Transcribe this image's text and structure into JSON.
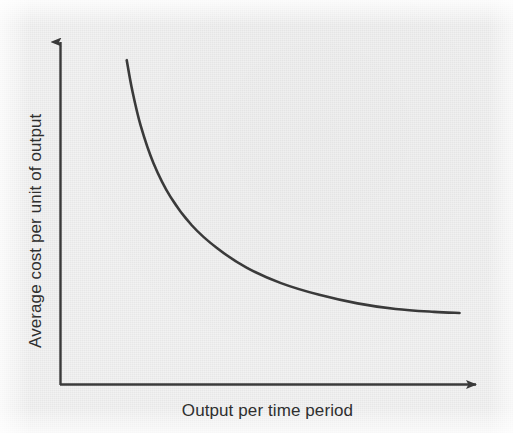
{
  "chart_data": {
    "type": "line",
    "title": "",
    "subtitle": "",
    "xlabel": "Output per time period",
    "ylabel": "Average cost per unit of output",
    "grid": false,
    "legend": null,
    "legend_position": "none",
    "axis_style": "arrow-headed, no tick marks, no numeric scale",
    "xlim": [
      0,
      1
    ],
    "ylim": [
      0,
      1
    ],
    "xticks": [],
    "yticks": [],
    "annotations": [],
    "series": [
      {
        "name": "Long-run average cost",
        "description": "Steeply falling convex curve that flattens toward a horizontal asymptote (economies of scale)",
        "color": "#3a3a3a",
        "line_width": 2.6,
        "x": [
          0.157,
          0.17,
          0.19,
          0.22,
          0.26,
          0.31,
          0.37,
          0.44,
          0.52,
          0.61,
          0.7,
          0.79,
          0.88,
          0.94
        ],
        "y": [
          0.915,
          0.83,
          0.73,
          0.625,
          0.53,
          0.45,
          0.385,
          0.33,
          0.287,
          0.254,
          0.23,
          0.214,
          0.206,
          0.203
        ]
      }
    ]
  },
  "figure": {
    "background_color": "#f2f2f2",
    "ink_color": "#3a3a3a",
    "label_color": "#2f2f2f"
  }
}
